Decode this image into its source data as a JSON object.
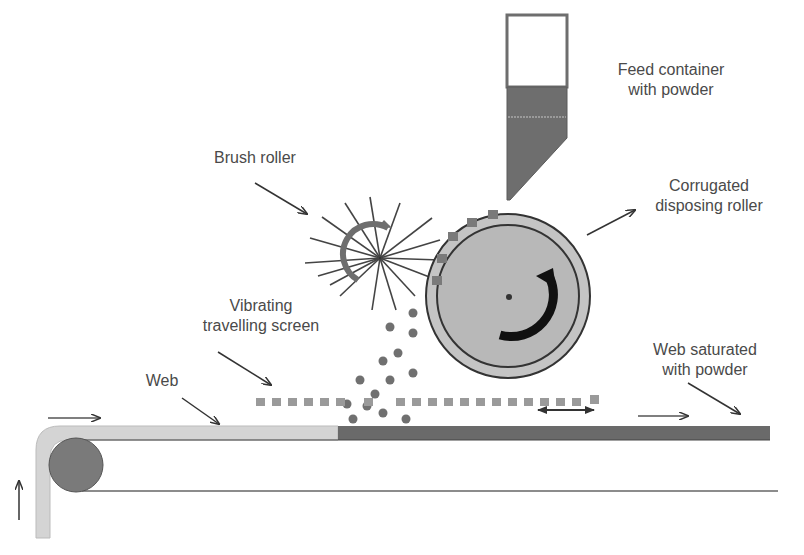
{
  "diagram": {
    "colors": {
      "line": "#333333",
      "text": "#4a4a4a",
      "roller_fill": "#b8b8b8",
      "powder": "#707070",
      "screen": "#9a9a9a",
      "web_clean": "#d4d4d4",
      "web_saturated": "#6a6a6a",
      "feed_powder": "#6e6e6e",
      "drive_roller": "#7a7a7a"
    },
    "labels": {
      "feed_container": {
        "line1": "Feed container",
        "line2": "with powder"
      },
      "corrugated_roller": {
        "line1": "Corrugated",
        "line2": "disposing roller"
      },
      "brush_roller": {
        "line1": "Brush roller"
      },
      "vibrating_screen": {
        "line1": "Vibrating",
        "line2": "travelling screen"
      },
      "web": {
        "line1": "Web"
      },
      "web_saturated": {
        "line1": "Web saturated",
        "line2": "with powder"
      }
    },
    "components": [
      {
        "id": "feed-container",
        "name": "Feed container with powder"
      },
      {
        "id": "corrugated-roller",
        "name": "Corrugated disposing roller",
        "rotation": "clockwise"
      },
      {
        "id": "brush-roller",
        "name": "Brush roller",
        "rotation": "counter-clockwise"
      },
      {
        "id": "vibrating-screen",
        "name": "Vibrating travelling screen",
        "motion": "oscillating horizontal"
      },
      {
        "id": "web",
        "name": "Web",
        "motion": "left-to-right"
      },
      {
        "id": "web-saturated",
        "name": "Web saturated with powder"
      },
      {
        "id": "drive-roller",
        "name": "Guide roller"
      }
    ]
  }
}
